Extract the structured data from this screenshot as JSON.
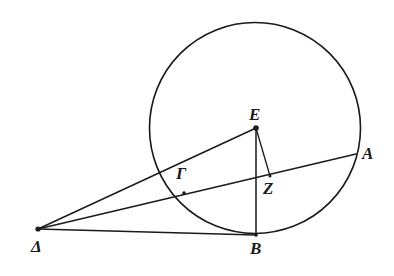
{
  "figure": {
    "canvas": {
      "width": 394,
      "height": 276
    },
    "background_color": "#ffffff",
    "stroke_color": "#1a1a1a"
  },
  "labels": {
    "A": "A",
    "B": "B",
    "gamma": "Γ",
    "delta": "Δ",
    "E": "E",
    "Z": "Z"
  },
  "points": {
    "A": {
      "x": 355,
      "y": 155
    },
    "B": {
      "x": 256,
      "y": 235
    },
    "gamma": {
      "x": 184,
      "y": 193
    },
    "delta": {
      "x": 38,
      "y": 229
    },
    "E": {
      "x": 256,
      "y": 128
    },
    "Z": {
      "x": 270,
      "y": 176
    }
  },
  "label_positions": {
    "A": {
      "x": 362,
      "y": 145
    },
    "B": {
      "x": 250,
      "y": 240
    },
    "gamma": {
      "x": 176,
      "y": 165
    },
    "delta": {
      "x": 31,
      "y": 238
    },
    "E": {
      "x": 249,
      "y": 106
    },
    "Z": {
      "x": 263,
      "y": 180
    }
  },
  "circle": {
    "center_x": 255,
    "center_y": 128,
    "radius": 105.5
  },
  "segments": [
    {
      "name": "delta-E",
      "from": "delta",
      "to": "E"
    },
    {
      "name": "delta-A",
      "from": "delta",
      "to": "A"
    },
    {
      "name": "delta-B",
      "from": "delta",
      "to": "B"
    },
    {
      "name": "E-B",
      "from": "E",
      "to": "B"
    },
    {
      "name": "E-Z",
      "from": "E",
      "to": "Z"
    }
  ],
  "vertices": [
    "delta",
    "E",
    "B",
    "A",
    "Z",
    "gamma"
  ]
}
